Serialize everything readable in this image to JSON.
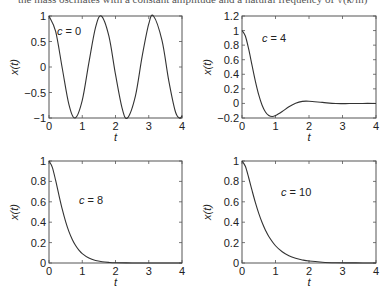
{
  "header": {
    "cropped_text": "the mass oscillates with a constant amplitude and a natural frequency of √(k/m)"
  },
  "style": {
    "line_color": "#333333",
    "axis_color": "#555555",
    "background": "#ffffff"
  },
  "chart_data": [
    {
      "type": "line",
      "title": "",
      "annotation": "c = 0",
      "xlabel": "t",
      "ylabel": "x(t)",
      "xlim": [
        0,
        4
      ],
      "ylim": [
        -1,
        1
      ],
      "xticks": [
        "0",
        "1",
        "2",
        "3",
        "4"
      ],
      "yticks": [
        "1",
        "0.5",
        "0",
        "−0.5",
        "−1"
      ],
      "yticks_values": [
        1,
        0.5,
        0,
        -0.5,
        -1
      ],
      "grid": false,
      "series": [
        {
          "name": "c = 0",
          "x": [
            0,
            0.2,
            0.4,
            0.6,
            0.785,
            1.0,
            1.2,
            1.4,
            1.571,
            1.8,
            2.0,
            2.2,
            2.356,
            2.6,
            2.8,
            3.0,
            3.142,
            3.4,
            3.6,
            3.8,
            3.927,
            4.0
          ],
          "values": [
            1,
            0.697,
            -0.029,
            -0.737,
            -1,
            -0.654,
            0.087,
            0.776,
            1,
            0.608,
            -0.146,
            -0.811,
            -1,
            -0.564,
            0.204,
            0.844,
            1,
            0.515,
            -0.261,
            -0.873,
            -1,
            -0.958
          ]
        }
      ],
      "plot_box": {
        "left": 49,
        "top": 16,
        "right": 182,
        "bottom": 118
      },
      "annotation_pos": {
        "x": 57,
        "y": 35
      }
    },
    {
      "type": "line",
      "title": "",
      "annotation": "c = 4",
      "xlabel": "t",
      "ylabel": "x(t)",
      "xlim": [
        0,
        4
      ],
      "ylim": [
        -0.2,
        1.2
      ],
      "xticks": [
        "0",
        "1",
        "2",
        "3",
        "4"
      ],
      "yticks": [
        "1.2",
        "1",
        "0.8",
        "0.6",
        "0.4",
        "0.2",
        "0",
        "−0.2"
      ],
      "yticks_values": [
        1.2,
        1,
        0.8,
        0.6,
        0.4,
        0.2,
        0,
        -0.2
      ],
      "grid": false,
      "series": [
        {
          "name": "c = 4",
          "x": [
            0,
            0.1,
            0.2,
            0.3,
            0.4,
            0.5,
            0.6,
            0.7,
            0.8,
            0.9,
            1.0,
            1.2,
            1.4,
            1.6,
            1.8,
            2.0,
            2.4,
            2.8,
            3.2,
            3.6,
            4.0
          ],
          "values": [
            1,
            0.925,
            0.744,
            0.522,
            0.304,
            0.117,
            -0.024,
            -0.117,
            -0.166,
            -0.18,
            -0.167,
            -0.111,
            -0.046,
            0.003,
            0.028,
            0.03,
            0.014,
            -0.002,
            -0.002,
            0.0,
            0.0
          ]
        }
      ],
      "plot_box": {
        "left": 242,
        "top": 16,
        "right": 376,
        "bottom": 118
      },
      "annotation_pos": {
        "x": 262,
        "y": 42
      }
    },
    {
      "type": "line",
      "title": "",
      "annotation": "c = 8",
      "xlabel": "t",
      "ylabel": "x(t)",
      "xlim": [
        0,
        4
      ],
      "ylim": [
        0,
        1
      ],
      "xticks": [
        "0",
        "1",
        "2",
        "3",
        "4"
      ],
      "yticks": [
        "1",
        "0.8",
        "0.6",
        "0.4",
        "0.2",
        "0"
      ],
      "yticks_values": [
        1,
        0.8,
        0.6,
        0.4,
        0.2,
        0
      ],
      "grid": false,
      "series": [
        {
          "name": "c = 8",
          "x": [
            0,
            0.1,
            0.2,
            0.3,
            0.4,
            0.5,
            0.6,
            0.7,
            0.8,
            0.9,
            1.0,
            1.2,
            1.4,
            1.6,
            1.8,
            2.0,
            2.5,
            3.0,
            3.5,
            4.0
          ],
          "values": [
            1,
            0.938,
            0.809,
            0.663,
            0.525,
            0.406,
            0.308,
            0.231,
            0.171,
            0.126,
            0.092,
            0.048,
            0.024,
            0.012,
            0.006,
            0.003,
            0.0005,
            0.0001,
            0,
            0
          ]
        }
      ],
      "plot_box": {
        "left": 49,
        "top": 161,
        "right": 182,
        "bottom": 263
      },
      "annotation_pos": {
        "x": 79,
        "y": 204
      }
    },
    {
      "type": "line",
      "title": "",
      "annotation": "c = 10",
      "xlabel": "t",
      "ylabel": "x(t)",
      "xlim": [
        0,
        4
      ],
      "ylim": [
        0,
        1
      ],
      "xticks": [
        "0",
        "1",
        "2",
        "3",
        "4"
      ],
      "yticks": [
        "1",
        "0.8",
        "0.6",
        "0.4",
        "0.2",
        "0"
      ],
      "yticks_values": [
        1,
        0.8,
        0.6,
        0.4,
        0.2,
        0
      ],
      "grid": false,
      "series": [
        {
          "name": "c = 10",
          "x": [
            0,
            0.1,
            0.2,
            0.3,
            0.4,
            0.5,
            0.6,
            0.7,
            0.8,
            1.0,
            1.2,
            1.4,
            1.6,
            1.8,
            2.0,
            2.4,
            2.8,
            3.2,
            3.6,
            4.0
          ],
          "values": [
            1,
            0.948,
            0.836,
            0.711,
            0.592,
            0.487,
            0.397,
            0.322,
            0.26,
            0.169,
            0.11,
            0.071,
            0.046,
            0.03,
            0.019,
            0.008,
            0.003,
            0.0014,
            0.0006,
            0.0002
          ]
        }
      ],
      "plot_box": {
        "left": 242,
        "top": 161,
        "right": 376,
        "bottom": 263
      },
      "annotation_pos": {
        "x": 281,
        "y": 196
      }
    }
  ]
}
